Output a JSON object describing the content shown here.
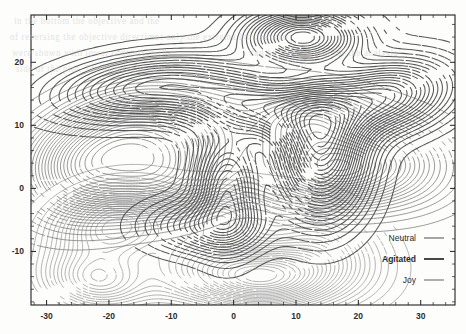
{
  "chart_data": {
    "type": "contour",
    "title": "",
    "xlabel": "",
    "ylabel": "",
    "xlim": [
      -32.5,
      35.5
    ],
    "ylim": [
      -18.5,
      27.5
    ],
    "xticks": [
      -30,
      -20,
      -10,
      0,
      10,
      20,
      30
    ],
    "yticks": [
      20,
      10,
      0,
      -10
    ],
    "xtick_labels": [
      "-30",
      "-20",
      "-10",
      "0",
      "10",
      "20",
      "30"
    ],
    "ytick_labels": [
      "20",
      "10",
      "0",
      "-10"
    ],
    "minor_tick_step": 2,
    "grid": false,
    "frame": true,
    "n_levels": 26,
    "legend_position": "bottom-right",
    "series": [
      {
        "name": "Neutral",
        "color": "#8c8c8c",
        "line_width": 0.7,
        "bold_label": false,
        "peaks": [
          {
            "x": -19.0,
            "y": -6.0,
            "amp": 0.62,
            "sx": 6.0,
            "sy": 3.6,
            "rot": 10
          },
          {
            "x": -22.0,
            "y": -14.5,
            "amp": 0.5,
            "sx": 5.2,
            "sy": 3.0,
            "rot": -5
          },
          {
            "x": 4.5,
            "y": -14.0,
            "amp": 1.0,
            "sx": 7.5,
            "sy": 3.2,
            "rot": 0
          },
          {
            "x": -6.0,
            "y": -10.0,
            "amp": 0.33,
            "sx": 7.0,
            "sy": 4.5,
            "rot": 25
          },
          {
            "x": 14.0,
            "y": -9.0,
            "amp": 0.3,
            "sx": 6.0,
            "sy": 4.0,
            "rot": -20
          },
          {
            "x": -2.0,
            "y": -4.5,
            "amp": 0.28,
            "sx": 4.0,
            "sy": 2.4,
            "rot": 0
          }
        ]
      },
      {
        "name": "Agitated",
        "color": "#4a4a4a",
        "line_width": 1.05,
        "bold_label": true,
        "peaks": [
          {
            "x": 11.0,
            "y": 24.0,
            "amp": 0.7,
            "sx": 5.5,
            "sy": 2.6,
            "rot": 0
          },
          {
            "x": 4.0,
            "y": 13.0,
            "amp": 0.55,
            "sx": 8.0,
            "sy": 3.2,
            "rot": -8
          },
          {
            "x": 24.0,
            "y": 14.5,
            "amp": 0.6,
            "sx": 6.5,
            "sy": 3.4,
            "rot": 12
          },
          {
            "x": 14.0,
            "y": 6.0,
            "amp": 0.85,
            "sx": 4.5,
            "sy": 6.5,
            "rot": 0
          },
          {
            "x": -14.0,
            "y": 16.0,
            "amp": 0.45,
            "sx": 9.0,
            "sy": 3.0,
            "rot": 6
          },
          {
            "x": -1.0,
            "y": 0.0,
            "amp": 0.48,
            "sx": 3.2,
            "sy": 5.5,
            "rot": 0
          },
          {
            "x": -4.0,
            "y": -6.0,
            "amp": 0.3,
            "sx": 6.0,
            "sy": 2.6,
            "rot": 0
          }
        ]
      },
      {
        "name": "Joy",
        "color": "#6f6f6f",
        "line_width": 0.75,
        "bold_label": false,
        "peaks": [
          {
            "x": -13.0,
            "y": 5.0,
            "amp": 1.0,
            "sx": 9.5,
            "sy": 4.2,
            "rot": 22
          },
          {
            "x": -20.0,
            "y": 8.5,
            "amp": 0.8,
            "sx": 8.0,
            "sy": 4.0,
            "rot": 20
          },
          {
            "x": -10.0,
            "y": 0.5,
            "amp": 0.55,
            "sx": 6.5,
            "sy": 3.2,
            "rot": 10
          },
          {
            "x": 15.0,
            "y": 3.0,
            "amp": 0.95,
            "sx": 7.5,
            "sy": 3.6,
            "rot": -4
          },
          {
            "x": 12.0,
            "y": 10.5,
            "amp": 0.62,
            "sx": 5.5,
            "sy": 3.0,
            "rot": 0
          },
          {
            "x": 24.0,
            "y": 5.0,
            "amp": 0.45,
            "sx": 7.0,
            "sy": 4.2,
            "rot": -10
          },
          {
            "x": -25.0,
            "y": 2.0,
            "amp": 0.4,
            "sx": 5.0,
            "sy": 4.0,
            "rot": 0
          }
        ]
      }
    ],
    "annotations": []
  },
  "legend": {
    "items": [
      {
        "label": "Neutral"
      },
      {
        "label": "Agitated"
      },
      {
        "label": "Joy"
      }
    ]
  },
  "background": {
    "bleed_text": [
      "in the bottom the objective and the",
      "of reversing the objective direction",
      "were shown with lower contrast in the",
      "side of the plot. The numerical values",
      "not only the extrema but also the",
      "can be seen as well for the analysis"
    ]
  },
  "colors": {
    "paper": "#fdfdfc",
    "frame": "#1f1f1f",
    "neutral": "#8c8c8c",
    "agitated": "#4a4a4a",
    "joy": "#6f6f6f",
    "text": "#2b2b2b"
  }
}
